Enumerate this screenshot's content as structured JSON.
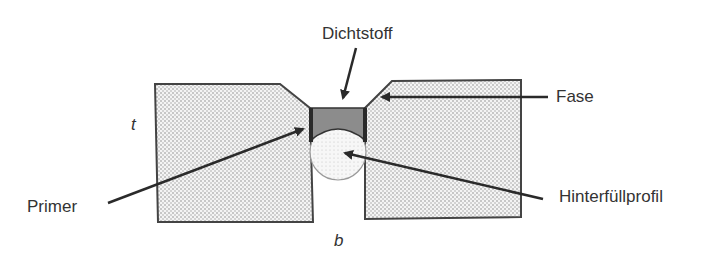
{
  "diagram": {
    "labels": {
      "sealant": "Dichtstoff",
      "chamfer": "Fase",
      "primer": "Primer",
      "backer_rod": "Hinterfüllprofil",
      "thickness": "t",
      "width": "b"
    },
    "colors": {
      "block_fill": "#e4e4e4",
      "block_stroke": "#444444",
      "sealant_fill": "#8c8c8c",
      "primer": "#2a2a2a",
      "backer_fill": "#f2f2f2",
      "arrow": "#2a2a2a"
    }
  }
}
